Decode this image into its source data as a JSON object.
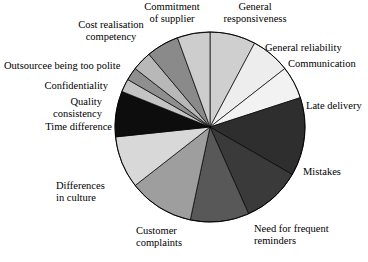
{
  "chart_data": {
    "type": "pie",
    "title": "",
    "subtitle": "",
    "xlabel": "",
    "ylabel": "",
    "legend_position": "callout-labels",
    "grid": false,
    "start_angle_deg": 0,
    "direction": "clockwise",
    "center": {
      "x": 210,
      "y": 127
    },
    "radius": 95,
    "categories": [
      "General responsiveness",
      "General reliability",
      "Communication",
      "Late delivery",
      "Mistakes",
      "Need for frequent reminders",
      "Customer complaints",
      "Differences in culture",
      "Time difference",
      "Quality consistency",
      "Confidentiality",
      "Outsourcee being too polite",
      "Cost realisation competency",
      "Commitment of supplier"
    ],
    "values": [
      7.8,
      6.7,
      5.6,
      13.3,
      10.0,
      10.0,
      11.1,
      8.9,
      7.8,
      2.2,
      2.2,
      3.3,
      5.6,
      5.6
    ],
    "colors": [
      "#cfcfcf",
      "#ededed",
      "#f2f2f2",
      "#2e2e2e",
      "#3a3a3a",
      "#585858",
      "#9e9e9e",
      "#d8d8d8",
      "#0d0d0d",
      "#c4c4c4",
      "#8f8f8f",
      "#b8b8b8",
      "#8a8a8a",
      "#cdcdcd"
    ],
    "slice_angles_deg": [
      {
        "name": "General responsiveness",
        "start": 0,
        "end": 28
      },
      {
        "name": "General reliability",
        "start": 28,
        "end": 52
      },
      {
        "name": "Communication",
        "start": 52,
        "end": 72
      },
      {
        "name": "Late delivery",
        "start": 72,
        "end": 120
      },
      {
        "name": "Mistakes",
        "start": 120,
        "end": 156
      },
      {
        "name": "Need for frequent reminders",
        "start": 156,
        "end": 192
      },
      {
        "name": "Customer complaints",
        "start": 192,
        "end": 232
      },
      {
        "name": "Differences in culture",
        "start": 232,
        "end": 264
      },
      {
        "name": "Time difference",
        "start": 264,
        "end": 292
      },
      {
        "name": "Quality consistency",
        "start": 292,
        "end": 300
      },
      {
        "name": "Confidentiality",
        "start": 300,
        "end": 308
      },
      {
        "name": "Outsourcee being too polite",
        "start": 308,
        "end": 320
      },
      {
        "name": "Cost realisation competency",
        "start": 320,
        "end": 340
      },
      {
        "name": "Commitment of supplier",
        "start": 340,
        "end": 360
      }
    ],
    "stroke_color": "#000000",
    "stroke_width": 0.7
  },
  "labels": {
    "commitment_of_supplier": "Commitment\nof supplier",
    "general_responsiveness": "General\nresponsiveness",
    "general_reliability": "General reliability",
    "communication": "Communication",
    "late_delivery": "Late delivery",
    "mistakes": "Mistakes",
    "need_for_frequent_reminders": "Need for frequent\nreminders",
    "customer_complaints": "Customer\ncomplaints",
    "differences_in_culture": "Differences\nin culture",
    "time_difference": "Time difference",
    "quality_consistency": "Quality\nconsistency",
    "confidentiality": "Confidentiality",
    "outsourcee_being_too_polite": "Outsourcee being too polite",
    "cost_realisation_competency": "Cost realisation\ncompetency"
  }
}
